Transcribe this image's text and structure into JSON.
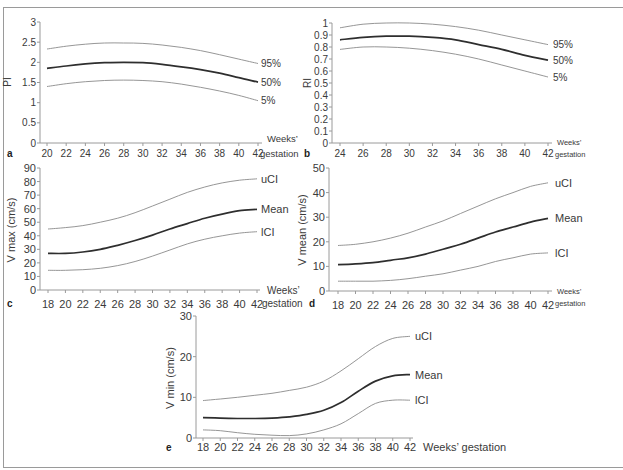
{
  "figure": {
    "panels": [
      "a",
      "b",
      "c",
      "d",
      "e"
    ]
  },
  "chart_data": [
    {
      "panel": "a",
      "type": "line",
      "title": "",
      "ylabel": "PI",
      "xlabel": "Weeks’ gestation",
      "xlabel_lines": [
        "Weeks’",
        "gestation"
      ],
      "x": [
        20,
        22,
        24,
        26,
        28,
        30,
        32,
        34,
        36,
        38,
        40,
        42
      ],
      "xticks": [
        20,
        22,
        24,
        26,
        28,
        30,
        32,
        34,
        36,
        38,
        40,
        42
      ],
      "yticks": [
        0,
        0.5,
        1,
        1.5,
        2,
        2.5,
        3
      ],
      "ytick_labels": [
        "0",
        "0.5",
        "1",
        "1.5",
        "2",
        "2.5",
        "3"
      ],
      "ylim": [
        0,
        3
      ],
      "grid": false,
      "legend": "inline labels at right end of each line",
      "series": [
        {
          "name": "95%",
          "values": [
            2.33,
            2.4,
            2.45,
            2.48,
            2.48,
            2.47,
            2.43,
            2.37,
            2.29,
            2.19,
            2.08,
            1.97
          ]
        },
        {
          "name": "50%",
          "emphasis": true,
          "values": [
            1.85,
            1.91,
            1.96,
            1.99,
            2.0,
            1.99,
            1.95,
            1.89,
            1.82,
            1.73,
            1.62,
            1.51
          ]
        },
        {
          "name": "5%",
          "values": [
            1.4,
            1.47,
            1.52,
            1.55,
            1.56,
            1.55,
            1.52,
            1.46,
            1.38,
            1.29,
            1.18,
            1.05
          ]
        }
      ]
    },
    {
      "panel": "b",
      "type": "line",
      "title": "",
      "ylabel": "RI",
      "xlabel": "Weeks’ gestation",
      "xlabel_lines": [
        "Weeks’",
        "gestation"
      ],
      "x": [
        24,
        26,
        28,
        30,
        32,
        34,
        36,
        38,
        40,
        42
      ],
      "xticks": [
        24,
        26,
        28,
        30,
        32,
        34,
        36,
        38,
        40,
        42
      ],
      "yticks": [
        0,
        0.1,
        0.2,
        0.3,
        0.4,
        0.5,
        0.6,
        0.7,
        0.8,
        0.9,
        1
      ],
      "ytick_labels": [
        "0",
        "0.1",
        "0.2",
        "0.3",
        "0.4",
        "0.5",
        "0.6",
        "0.7",
        "0.8",
        "0.9",
        "1"
      ],
      "ylim": [
        0,
        1
      ],
      "grid": false,
      "legend": "inline labels at right end of each line",
      "series": [
        {
          "name": "95%",
          "values": [
            0.96,
            0.99,
            1.0,
            1.0,
            0.99,
            0.97,
            0.94,
            0.9,
            0.86,
            0.82
          ]
        },
        {
          "name": "50%",
          "emphasis": true,
          "values": [
            0.86,
            0.88,
            0.89,
            0.89,
            0.88,
            0.86,
            0.82,
            0.78,
            0.73,
            0.69
          ]
        },
        {
          "name": "5%",
          "values": [
            0.78,
            0.8,
            0.8,
            0.79,
            0.77,
            0.74,
            0.7,
            0.65,
            0.6,
            0.55
          ]
        }
      ]
    },
    {
      "panel": "c",
      "type": "line",
      "title": "",
      "ylabel": "V max (cm/s)",
      "xlabel": "Weeks’ gestation",
      "xlabel_lines": [
        "Weeks’",
        "gestation"
      ],
      "x": [
        18,
        20,
        22,
        24,
        26,
        28,
        30,
        32,
        34,
        36,
        38,
        40,
        42
      ],
      "xticks": [
        18,
        20,
        22,
        24,
        26,
        28,
        30,
        32,
        34,
        36,
        38,
        40,
        42
      ],
      "yticks": [
        0,
        10,
        20,
        30,
        40,
        50,
        60,
        70,
        80,
        90
      ],
      "ytick_labels": [
        "0",
        "10",
        "20",
        "30",
        "40",
        "50",
        "60",
        "70",
        "80",
        "90"
      ],
      "ylim": [
        0,
        90
      ],
      "grid": false,
      "legend": "inline labels at right end of each line",
      "series": [
        {
          "name": "uCI",
          "values": [
            45,
            46,
            47.5,
            50,
            53,
            57,
            62,
            67,
            72,
            76,
            79,
            81,
            82
          ]
        },
        {
          "name": "Mean",
          "emphasis": true,
          "values": [
            27,
            27,
            28,
            30,
            33,
            36.5,
            40.5,
            45,
            49,
            53,
            56,
            58.5,
            59.5
          ]
        },
        {
          "name": "lCI",
          "values": [
            14.5,
            14.5,
            15,
            16,
            18,
            21,
            25,
            29.5,
            34,
            37.5,
            40,
            42,
            43
          ]
        }
      ]
    },
    {
      "panel": "d",
      "type": "line",
      "title": "",
      "ylabel": "V mean (cm/s)",
      "xlabel": "Weeks’ gestation",
      "xlabel_lines": [
        "Weeks’",
        "gestation"
      ],
      "x": [
        18,
        20,
        22,
        24,
        26,
        28,
        30,
        32,
        34,
        36,
        38,
        40,
        42
      ],
      "xticks": [
        18,
        20,
        22,
        24,
        26,
        28,
        30,
        32,
        34,
        36,
        38,
        40,
        42
      ],
      "yticks": [
        0,
        10,
        20,
        30,
        40,
        50
      ],
      "ytick_labels": [
        "0",
        "10",
        "20",
        "30",
        "40",
        "50"
      ],
      "ylim": [
        0,
        50
      ],
      "grid": false,
      "legend": "inline labels at right end of each line",
      "series": [
        {
          "name": "uCI",
          "values": [
            18.5,
            19,
            20,
            21.5,
            23.5,
            26,
            28.5,
            31.5,
            34.5,
            37.5,
            40,
            42.5,
            44
          ]
        },
        {
          "name": "Mean",
          "emphasis": true,
          "values": [
            10.7,
            11,
            11.5,
            12.5,
            13.5,
            15,
            17,
            19,
            21.5,
            24,
            26,
            28,
            29.5
          ]
        },
        {
          "name": "lCI",
          "values": [
            4,
            4,
            4,
            4.3,
            5,
            6,
            7,
            8.5,
            10,
            12,
            13.5,
            15,
            15.5
          ]
        }
      ]
    },
    {
      "panel": "e",
      "type": "line",
      "title": "",
      "ylabel": "V min (cm/s)",
      "xlabel": "Weeks’ gestation",
      "xlabel_lines": [
        "Weeks’ gestation"
      ],
      "x": [
        18,
        20,
        22,
        24,
        26,
        28,
        30,
        32,
        34,
        36,
        38,
        40,
        42
      ],
      "xticks": [
        18,
        20,
        22,
        24,
        26,
        28,
        30,
        32,
        34,
        36,
        38,
        40,
        42
      ],
      "yticks": [
        0,
        10,
        20,
        30
      ],
      "ytick_labels": [
        "0",
        "10",
        "20",
        "30"
      ],
      "ylim": [
        0,
        30
      ],
      "grid": false,
      "legend": "inline labels at right end of each line",
      "series": [
        {
          "name": "uCI",
          "values": [
            9.2,
            9.6,
            10,
            10.5,
            11,
            11.7,
            12.5,
            14,
            16.5,
            19.5,
            22.5,
            24.5,
            25
          ]
        },
        {
          "name": "Mean",
          "emphasis": true,
          "values": [
            5,
            4.9,
            4.8,
            4.8,
            4.9,
            5.2,
            5.8,
            6.8,
            8.7,
            11.5,
            14,
            15.3,
            15.6
          ]
        },
        {
          "name": "lCI",
          "values": [
            2,
            1.8,
            1.3,
            0.9,
            0.7,
            0.6,
            1,
            2,
            3.5,
            6,
            8.5,
            9.3,
            9.3
          ]
        }
      ]
    }
  ],
  "colors": {
    "axis": "#9a9a9a",
    "bound_line": "#8a8a8a",
    "mean_line": "#2e2e2e",
    "text": "#3a3a3a"
  }
}
